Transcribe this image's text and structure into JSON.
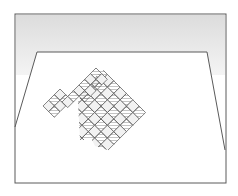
{
  "illustration": {
    "description": "Pencil sketch of a torn checkerboard lying on a table seen in perspective inside a framed box",
    "colors": {
      "background": "#ffffff",
      "line": "#5a5a5a",
      "shade_wall": "#e6e6e6",
      "tile_dark": "#a8a8a8",
      "tile_light": "#f2f2f2"
    },
    "frame": {
      "x": 15,
      "y": 14,
      "w": 211,
      "h": 169
    },
    "table": {
      "points": "37,52 207,52 225,150 15,127"
    },
    "board": {
      "origin": [
        101,
        71
      ],
      "tile": 10,
      "angle": 45,
      "rows": 8,
      "cols": 7
    }
  }
}
